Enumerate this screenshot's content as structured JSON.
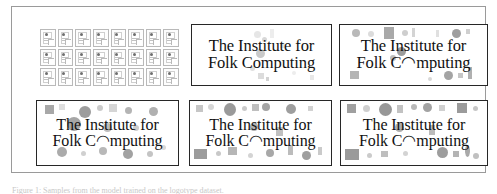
{
  "figure": {
    "caption": "Figure 1: Samples from the model trained on the logotype dataset."
  },
  "icon_grid": {
    "name": "training-thumbnail-grid",
    "columns": 8,
    "rows": 3,
    "count": 24,
    "item_label": "document-thumbnail"
  },
  "logotype": {
    "line1": "The Institute for",
    "line2": "Folk Computing"
  },
  "panels": [
    {
      "id": "panel-top-mid",
      "name": "sample-panel-1",
      "line1": "The Institute for",
      "line2": "Folk Computing",
      "noise_level": "low"
    },
    {
      "id": "panel-top-right",
      "name": "sample-panel-2",
      "line1": "The Institute for",
      "line2": "Folk C◠mputing",
      "noise_level": "medium"
    },
    {
      "id": "panel-bot-left",
      "name": "sample-panel-3",
      "line1": "The Institute for",
      "line2": "Folk C◠mputing",
      "noise_level": "medium-high"
    },
    {
      "id": "panel-bot-mid",
      "name": "sample-panel-4",
      "line1": "The Institute for",
      "line2": "Folk C◠mputing",
      "noise_level": "high"
    },
    {
      "id": "panel-bot-right",
      "name": "sample-panel-5",
      "line1": "The Institute for",
      "line2": "Folk C◠mputing",
      "noise_level": "highest"
    }
  ],
  "colors": {
    "ink": "#111111",
    "panel_border": "#272727",
    "frame_border": "#9a9a9a",
    "background": "#ffffff",
    "blob_dark": "#8f8f8f",
    "blob_mid": "#b3b3b3",
    "blob_light": "#d6d6d6",
    "blob_faint": "#ececec"
  },
  "noise_shapes": {
    "panel-top-mid": [
      {
        "t": "c",
        "x": 62,
        "y": 6,
        "w": 7,
        "h": 7,
        "c": "#e6e6e6"
      },
      {
        "t": "c",
        "x": 70,
        "y": 12,
        "w": 5,
        "h": 5,
        "c": "#d8d8d8"
      },
      {
        "t": "r",
        "x": 78,
        "y": 4,
        "w": 4,
        "h": 9,
        "c": "#ededed"
      },
      {
        "t": "c",
        "x": 64,
        "y": 24,
        "w": 9,
        "h": 9,
        "c": "#c9c9c9"
      },
      {
        "t": "r",
        "x": 88,
        "y": 18,
        "w": 5,
        "h": 5,
        "c": "#e4e4e4"
      },
      {
        "t": "c",
        "x": 58,
        "y": 41,
        "w": 5,
        "h": 5,
        "c": "#e0e0e0"
      },
      {
        "t": "r",
        "x": 66,
        "y": 48,
        "w": 6,
        "h": 6,
        "c": "#dcdcdc"
      },
      {
        "t": "r",
        "x": 118,
        "y": 50,
        "w": 4,
        "h": 5,
        "c": "#e8e8e8"
      },
      {
        "t": "c",
        "x": 100,
        "y": 46,
        "w": 4,
        "h": 4,
        "c": "#ededed"
      },
      {
        "t": "r",
        "x": 74,
        "y": 52,
        "w": 3,
        "h": 4,
        "c": "#d2d2d2"
      }
    ],
    "panel-top-right": [
      {
        "t": "c",
        "x": 12,
        "y": 4,
        "w": 8,
        "h": 8,
        "c": "#b9b9b9"
      },
      {
        "t": "c",
        "x": 28,
        "y": 6,
        "w": 6,
        "h": 6,
        "c": "#dcdcdc"
      },
      {
        "t": "r",
        "x": 44,
        "y": 2,
        "w": 10,
        "h": 12,
        "c": "#a9a9a9"
      },
      {
        "t": "c",
        "x": 62,
        "y": 5,
        "w": 6,
        "h": 6,
        "c": "#cecece"
      },
      {
        "t": "r",
        "x": 72,
        "y": 3,
        "w": 3,
        "h": 9,
        "c": "#d4d4d4"
      },
      {
        "t": "r",
        "x": 96,
        "y": 5,
        "w": 3,
        "h": 7,
        "c": "#e0e0e0"
      },
      {
        "t": "c",
        "x": 112,
        "y": 4,
        "w": 9,
        "h": 9,
        "c": "#9f9f9f"
      },
      {
        "t": "r",
        "x": 126,
        "y": 4,
        "w": 4,
        "h": 5,
        "c": "#cfcfcf"
      },
      {
        "t": "c",
        "x": 57,
        "y": 22,
        "w": 9,
        "h": 9,
        "c": "#9b9b9b"
      },
      {
        "t": "c",
        "x": 50,
        "y": 30,
        "w": 6,
        "h": 6,
        "c": "#bdbdbd"
      },
      {
        "t": "r",
        "x": 10,
        "y": 46,
        "w": 9,
        "h": 8,
        "c": "#b5b5b5"
      },
      {
        "t": "c",
        "x": 104,
        "y": 46,
        "w": 9,
        "h": 9,
        "c": "#a4a4a4"
      },
      {
        "t": "r",
        "x": 118,
        "y": 48,
        "w": 5,
        "h": 5,
        "c": "#c6c6c6"
      },
      {
        "t": "r",
        "x": 128,
        "y": 42,
        "w": 4,
        "h": 12,
        "c": "#b0b0b0"
      },
      {
        "t": "c",
        "x": 88,
        "y": 52,
        "w": 4,
        "h": 4,
        "c": "#d8d8d8"
      }
    ],
    "panel-bot-left": [
      {
        "t": "r",
        "x": 8,
        "y": 4,
        "w": 9,
        "h": 9,
        "c": "#a8a8a8"
      },
      {
        "t": "r",
        "x": 22,
        "y": 3,
        "w": 6,
        "h": 6,
        "c": "#dedede"
      },
      {
        "t": "c",
        "x": 42,
        "y": 5,
        "w": 12,
        "h": 12,
        "c": "#9d9d9d"
      },
      {
        "t": "c",
        "x": 60,
        "y": 4,
        "w": 6,
        "h": 6,
        "c": "#cbcbcb"
      },
      {
        "t": "r",
        "x": 72,
        "y": 3,
        "w": 8,
        "h": 8,
        "c": "#d5d5d5"
      },
      {
        "t": "c",
        "x": 88,
        "y": 6,
        "w": 7,
        "h": 7,
        "c": "#b4b4b4"
      },
      {
        "t": "c",
        "x": 112,
        "y": 6,
        "w": 9,
        "h": 9,
        "c": "#b0b0b0"
      },
      {
        "t": "c",
        "x": 30,
        "y": 16,
        "w": 14,
        "h": 14,
        "c": "#a6a6a6"
      },
      {
        "t": "c",
        "x": 66,
        "y": 22,
        "w": 9,
        "h": 9,
        "c": "#bcbcbc"
      },
      {
        "t": "c",
        "x": 96,
        "y": 24,
        "w": 6,
        "h": 6,
        "c": "#cdcdcd"
      },
      {
        "t": "c",
        "x": 20,
        "y": 46,
        "w": 10,
        "h": 10,
        "c": "#ababab"
      },
      {
        "t": "c",
        "x": 44,
        "y": 50,
        "w": 5,
        "h": 5,
        "c": "#d0d0d0"
      },
      {
        "t": "c",
        "x": 62,
        "y": 46,
        "w": 8,
        "h": 8,
        "c": "#b8b8b8"
      },
      {
        "t": "c",
        "x": 86,
        "y": 48,
        "w": 10,
        "h": 10,
        "c": "#a2a2a2"
      },
      {
        "t": "c",
        "x": 110,
        "y": 50,
        "w": 6,
        "h": 6,
        "c": "#c4c4c4"
      },
      {
        "t": "c",
        "x": 124,
        "y": 44,
        "w": 5,
        "h": 5,
        "c": "#d9d9d9"
      }
    ],
    "panel-bot-mid": [
      {
        "t": "r",
        "x": 6,
        "y": 4,
        "w": 7,
        "h": 7,
        "c": "#c6c6c6"
      },
      {
        "t": "c",
        "x": 18,
        "y": 3,
        "w": 6,
        "h": 6,
        "c": "#d6d6d6"
      },
      {
        "t": "c",
        "x": 34,
        "y": 2,
        "w": 12,
        "h": 13,
        "c": "#9a9a9a"
      },
      {
        "t": "c",
        "x": 52,
        "y": 5,
        "w": 5,
        "h": 5,
        "c": "#cacaca"
      },
      {
        "t": "r",
        "x": 62,
        "y": 3,
        "w": 7,
        "h": 7,
        "c": "#bfbfbf"
      },
      {
        "t": "c",
        "x": 72,
        "y": 2,
        "w": 8,
        "h": 8,
        "c": "#a5a5a5"
      },
      {
        "t": "c",
        "x": 96,
        "y": 3,
        "w": 10,
        "h": 10,
        "c": "#9e9e9e"
      },
      {
        "t": "r",
        "x": 118,
        "y": 5,
        "w": 5,
        "h": 5,
        "c": "#d2d2d2"
      },
      {
        "t": "c",
        "x": 60,
        "y": 22,
        "w": 8,
        "h": 8,
        "c": "#b2b2b2"
      },
      {
        "t": "r",
        "x": 86,
        "y": 26,
        "w": 7,
        "h": 9,
        "c": "#c0c0c0"
      },
      {
        "t": "r",
        "x": 4,
        "y": 48,
        "w": 13,
        "h": 10,
        "c": "#9c9c9c"
      },
      {
        "t": "c",
        "x": 26,
        "y": 50,
        "w": 5,
        "h": 5,
        "c": "#c8c8c8"
      },
      {
        "t": "r",
        "x": 38,
        "y": 46,
        "w": 9,
        "h": 8,
        "c": "#b6b6b6"
      },
      {
        "t": "c",
        "x": 58,
        "y": 52,
        "w": 5,
        "h": 5,
        "c": "#d4d4d4"
      },
      {
        "t": "c",
        "x": 76,
        "y": 48,
        "w": 8,
        "h": 8,
        "c": "#a8a8a8"
      },
      {
        "t": "r",
        "x": 98,
        "y": 44,
        "w": 5,
        "h": 10,
        "c": "#bcbcbc"
      },
      {
        "t": "c",
        "x": 112,
        "y": 50,
        "w": 9,
        "h": 9,
        "c": "#9f9f9f"
      },
      {
        "t": "r",
        "x": 128,
        "y": 46,
        "w": 4,
        "h": 8,
        "c": "#cacaca"
      }
    ],
    "panel-bot-right": [
      {
        "t": "r",
        "x": 6,
        "y": 3,
        "w": 9,
        "h": 9,
        "c": "#a0a0a0"
      },
      {
        "t": "c",
        "x": 22,
        "y": 4,
        "w": 7,
        "h": 7,
        "c": "#cfcfcf"
      },
      {
        "t": "c",
        "x": 38,
        "y": 2,
        "w": 13,
        "h": 13,
        "c": "#979797"
      },
      {
        "t": "r",
        "x": 56,
        "y": 4,
        "w": 6,
        "h": 8,
        "c": "#c2c2c2"
      },
      {
        "t": "c",
        "x": 70,
        "y": 3,
        "w": 6,
        "h": 6,
        "c": "#b8b8b8"
      },
      {
        "t": "c",
        "x": 82,
        "y": 2,
        "w": 9,
        "h": 9,
        "c": "#a3a3a3"
      },
      {
        "t": "r",
        "x": 98,
        "y": 4,
        "w": 6,
        "h": 6,
        "c": "#d0d0d0"
      },
      {
        "t": "r",
        "x": 116,
        "y": 2,
        "w": 10,
        "h": 10,
        "c": "#9b9b9b"
      },
      {
        "t": "c",
        "x": 132,
        "y": 5,
        "w": 5,
        "h": 5,
        "c": "#c7c7c7"
      },
      {
        "t": "c",
        "x": 54,
        "y": 22,
        "w": 9,
        "h": 9,
        "c": "#adadad"
      },
      {
        "t": "r",
        "x": 88,
        "y": 24,
        "w": 6,
        "h": 10,
        "c": "#bbbbbb"
      },
      {
        "t": "r",
        "x": 4,
        "y": 48,
        "w": 14,
        "h": 11,
        "c": "#9a9a9a"
      },
      {
        "t": "c",
        "x": 26,
        "y": 52,
        "w": 5,
        "h": 5,
        "c": "#cbcbcb"
      },
      {
        "t": "r",
        "x": 40,
        "y": 50,
        "w": 7,
        "h": 6,
        "c": "#bebebe"
      },
      {
        "t": "c",
        "x": 62,
        "y": 50,
        "w": 5,
        "h": 5,
        "c": "#d3d3d3"
      },
      {
        "t": "c",
        "x": 96,
        "y": 46,
        "w": 11,
        "h": 11,
        "c": "#9d9d9d"
      },
      {
        "t": "r",
        "x": 112,
        "y": 50,
        "w": 6,
        "h": 6,
        "c": "#b4b4b4"
      },
      {
        "t": "c",
        "x": 124,
        "y": 44,
        "w": 5,
        "h": 12,
        "c": "#a9a9a9"
      },
      {
        "t": "c",
        "x": 132,
        "y": 52,
        "w": 6,
        "h": 6,
        "c": "#c0c0c0"
      }
    ]
  }
}
